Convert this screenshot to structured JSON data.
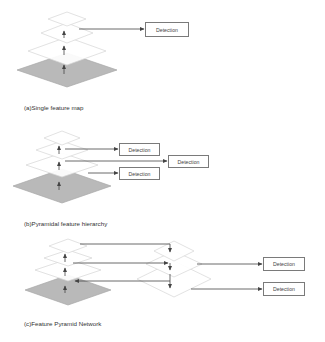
{
  "colors": {
    "background": "#ffffff",
    "base_map_fill": "#b9b9b9",
    "base_map_stroke": "#a8a8a8",
    "layer_fill": "#ffffff",
    "layer_stroke": "#d6d6d6",
    "arrow": "#444444",
    "box_border": "#7a7a7a"
  },
  "panels": [
    {
      "id": "a",
      "caption": "(a)Single feature map",
      "caption_pos": [
        24,
        104
      ],
      "diamonds": [
        {
          "cx": 67,
          "cy": 70,
          "hw": 50,
          "hh": 17,
          "kind": "base"
        },
        {
          "cx": 67,
          "cy": 51,
          "hw": 39,
          "hh": 14,
          "kind": "layer"
        },
        {
          "cx": 67,
          "cy": 33,
          "hw": 26,
          "hh": 10,
          "kind": "layer"
        },
        {
          "cx": 67,
          "cy": 19,
          "hw": 19,
          "hh": 7,
          "kind": "layer"
        }
      ],
      "up_arrows": [
        {
          "x": 64,
          "y1": 38,
          "y2": 31
        },
        {
          "x": 64,
          "y1": 55,
          "y2": 46
        },
        {
          "x": 64,
          "y1": 74,
          "y2": 65
        }
      ],
      "lines": [
        {
          "points": [
            [
              79,
              29
            ],
            [
              144,
              29
            ]
          ],
          "head": "end"
        }
      ],
      "boxes": [
        {
          "label": "Detection",
          "x": 145,
          "y": 22,
          "w": 44,
          "h": 15
        }
      ]
    },
    {
      "id": "b",
      "caption": "(b)Pyramidal feature hierarchy",
      "caption_pos": [
        24,
        220
      ],
      "diamonds": [
        {
          "cx": 62,
          "cy": 186,
          "hw": 49,
          "hh": 17,
          "kind": "base"
        },
        {
          "cx": 62,
          "cy": 165,
          "hw": 36,
          "hh": 12,
          "kind": "layer"
        },
        {
          "cx": 62,
          "cy": 150,
          "hw": 26,
          "hh": 9,
          "kind": "layer"
        },
        {
          "cx": 62,
          "cy": 138,
          "hw": 18,
          "hh": 7,
          "kind": "layer"
        }
      ],
      "up_arrows": [
        {
          "x": 59,
          "y1": 154,
          "y2": 146
        },
        {
          "x": 59,
          "y1": 170,
          "y2": 162
        },
        {
          "x": 59,
          "y1": 190,
          "y2": 182
        }
      ],
      "lines": [
        {
          "points": [
            [
              65,
              149
            ],
            [
              118,
              149
            ]
          ],
          "head": "end"
        },
        {
          "points": [
            [
              65,
              161
            ],
            [
              167,
              161
            ]
          ],
          "head": "end"
        },
        {
          "points": [
            [
              88,
              173
            ],
            [
              118,
              173
            ]
          ],
          "head": "end"
        }
      ],
      "boxes": [
        {
          "label": "Detection",
          "x": 119,
          "y": 143,
          "w": 41,
          "h": 13
        },
        {
          "label": "Detection",
          "x": 168,
          "y": 155,
          "w": 41,
          "h": 13
        },
        {
          "label": "Detection",
          "x": 119,
          "y": 167,
          "w": 41,
          "h": 13
        }
      ]
    },
    {
      "id": "c",
      "caption": "(c)Feature Pyramid Network",
      "caption_pos": [
        24,
        320
      ],
      "diamonds": [
        {
          "cx": 68,
          "cy": 290,
          "hw": 43,
          "hh": 15,
          "kind": "base"
        },
        {
          "cx": 68,
          "cy": 270,
          "hw": 33,
          "hh": 11,
          "kind": "layer"
        },
        {
          "cx": 68,
          "cy": 258,
          "hw": 24,
          "hh": 8,
          "kind": "layer"
        },
        {
          "cx": 68,
          "cy": 246,
          "hw": 19,
          "hh": 7,
          "kind": "layer"
        },
        {
          "cx": 174,
          "cy": 279,
          "hw": 37,
          "hh": 18,
          "kind": "layer"
        },
        {
          "cx": 174,
          "cy": 264,
          "hw": 28,
          "hh": 13,
          "kind": "layer"
        },
        {
          "cx": 174,
          "cy": 251,
          "hw": 20,
          "hh": 10,
          "kind": "layer"
        }
      ],
      "up_arrows": [
        {
          "x": 65,
          "y1": 262,
          "y2": 254
        },
        {
          "x": 65,
          "y1": 276,
          "y2": 268
        },
        {
          "x": 65,
          "y1": 293,
          "y2": 286
        }
      ],
      "lines": [
        {
          "points": [
            [
              80,
              244
            ],
            [
              170,
              244
            ],
            [
              170,
              252
            ]
          ],
          "head": "end"
        },
        {
          "points": [
            [
              73,
              263
            ],
            [
              168,
              263
            ]
          ],
          "head": "end"
        },
        {
          "points": [
            [
              170,
              263
            ],
            [
              170,
              270
            ]
          ],
          "head": "end"
        },
        {
          "points": [
            [
              170,
              281
            ],
            [
              75,
              281
            ]
          ],
          "head": "end"
        },
        {
          "points": [
            [
              170,
              274
            ],
            [
              170,
              288
            ]
          ],
          "head": "end"
        },
        {
          "points": [
            [
              197,
              264
            ],
            [
              262,
              264
            ]
          ],
          "head": "end"
        },
        {
          "points": [
            [
              191,
              289
            ],
            [
              262,
              289
            ]
          ],
          "head": "end"
        }
      ],
      "boxes": [
        {
          "label": "Detection",
          "x": 263,
          "y": 257,
          "w": 42,
          "h": 14
        },
        {
          "label": "Detection",
          "x": 263,
          "y": 282,
          "w": 42,
          "h": 14
        }
      ]
    }
  ]
}
